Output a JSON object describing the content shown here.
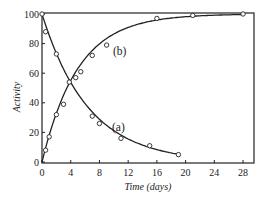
{
  "chart_data": {
    "type": "line",
    "title": "",
    "xlabel": "Time (days)",
    "ylabel": "Activity",
    "xlim": [
      0,
      30
    ],
    "ylim": [
      0,
      100
    ],
    "xticks": [
      0,
      4,
      8,
      12,
      16,
      20,
      24,
      28
    ],
    "yticks": [
      0,
      20,
      40,
      60,
      80,
      100
    ],
    "grid": false,
    "legend": "inline curve labels",
    "series": [
      {
        "name": "(a)",
        "label_position": [
          11,
          24
        ],
        "marker": "open-circle",
        "points": [
          [
            0,
            100
          ],
          [
            0.5,
            88
          ],
          [
            2,
            73
          ],
          [
            3.8,
            54
          ],
          [
            7,
            31
          ],
          [
            8,
            26
          ],
          [
            11,
            16
          ],
          [
            15,
            11
          ],
          [
            19,
            5
          ]
        ]
      },
      {
        "name": "(b)",
        "label_position": [
          11,
          75
        ],
        "marker": "open-circle",
        "points": [
          [
            0.5,
            8
          ],
          [
            1,
            17
          ],
          [
            2,
            32
          ],
          [
            3,
            39
          ],
          [
            4.7,
            57
          ],
          [
            5.4,
            61
          ],
          [
            7,
            72
          ],
          [
            9,
            79
          ],
          [
            16,
            97
          ],
          [
            21,
            99
          ],
          [
            28,
            100
          ]
        ]
      }
    ]
  },
  "labels": {
    "xlabel": "Time (days)",
    "ylabel": "Activity",
    "series_a": "(a)",
    "series_b": "(b)",
    "xticks": [
      "0",
      "4",
      "8",
      "12",
      "16",
      "20",
      "24",
      "28"
    ],
    "yticks": [
      "0",
      "20",
      "40",
      "60",
      "80",
      "100"
    ]
  },
  "colors": {
    "line": "#222222",
    "background": "#ffffff"
  }
}
